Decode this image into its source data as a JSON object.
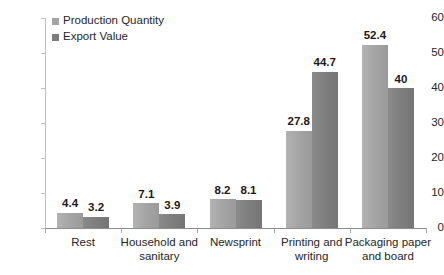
{
  "chart_data": {
    "type": "bar",
    "title": "",
    "subtitle": "",
    "xlabel": "",
    "ylabel": "",
    "ylim": [
      0,
      60
    ],
    "yticks": [
      0,
      10,
      20,
      30,
      40,
      50,
      60
    ],
    "ytick_labels": [
      "0",
      "10",
      "20",
      "30",
      "40",
      "50",
      "60"
    ],
    "grid": false,
    "legend_position": "top-left-inside",
    "categories": [
      "Rest",
      "Household and sanitary",
      "Newsprint",
      "Printing and writing",
      "Packaging paper and board"
    ],
    "category_lines": [
      [
        "Rest"
      ],
      [
        "Household and",
        "sanitary"
      ],
      [
        "Newsprint"
      ],
      [
        "Printing and",
        "writing"
      ],
      [
        "Packaging paper",
        "and board"
      ]
    ],
    "series": [
      {
        "name": "Production Quantity",
        "color": "#a3a3a3",
        "values": [
          4.4,
          7.1,
          8.2,
          27.8,
          52.4
        ],
        "labels": [
          "4.4",
          "7.1",
          "8.2",
          "27.8",
          "52.4"
        ]
      },
      {
        "name": "Export Value",
        "color": "#7d7d7d",
        "values": [
          3.2,
          3.9,
          8.1,
          44.7,
          40
        ],
        "labels": [
          "3.2",
          "3.9",
          "8.1",
          "44.7",
          "40"
        ]
      }
    ]
  }
}
